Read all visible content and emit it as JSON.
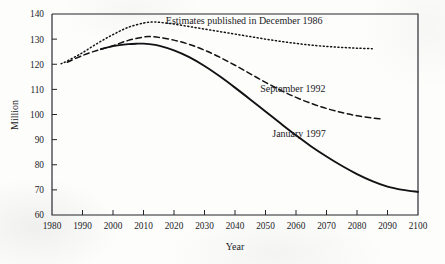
{
  "chart_data": {
    "type": "line",
    "title": "",
    "xlabel": "Year",
    "ylabel": "Million",
    "xlim": [
      1980,
      2100
    ],
    "ylim": [
      60,
      140
    ],
    "grid": false,
    "legend_position": "inline-annotations",
    "x_ticks": [
      1980,
      1990,
      2000,
      2010,
      2020,
      2030,
      2040,
      2050,
      2060,
      2070,
      2080,
      2090,
      2100
    ],
    "y_ticks": [
      60,
      70,
      80,
      90,
      100,
      110,
      120,
      130,
      140
    ],
    "series": [
      {
        "name": "Estimates published in December 1986",
        "style": "dotted",
        "label_x": 2043,
        "label_y": 137.5,
        "x": [
          1983,
          1985,
          1990,
          1995,
          2000,
          2005,
          2010,
          2013,
          2015,
          2020,
          2025,
          2030,
          2035,
          2040,
          2045,
          2050,
          2055,
          2060,
          2065,
          2070,
          2075,
          2080,
          2085
        ],
        "values": [
          120.2,
          121.3,
          124.6,
          128.4,
          131.8,
          134.7,
          136.4,
          136.8,
          136.7,
          136.0,
          135.0,
          134.0,
          133.0,
          132.0,
          131.0,
          130.0,
          129.1,
          128.3,
          127.6,
          127.1,
          126.7,
          126.4,
          126.2
        ]
      },
      {
        "name": "September 1992",
        "style": "dashed",
        "label_x": 2059,
        "label_y": 110.5,
        "x": [
          1985,
          1990,
          1995,
          2000,
          2005,
          2010,
          2012,
          2015,
          2020,
          2025,
          2030,
          2035,
          2040,
          2045,
          2050,
          2055,
          2060,
          2065,
          2070,
          2075,
          2080,
          2085,
          2088
        ],
        "values": [
          120.8,
          123.5,
          125.6,
          127.4,
          129.5,
          130.8,
          131.0,
          130.7,
          129.6,
          127.9,
          125.6,
          122.8,
          119.6,
          116.2,
          112.8,
          109.6,
          106.8,
          104.4,
          102.4,
          100.8,
          99.5,
          98.6,
          98.2
        ]
      },
      {
        "name": "January 1997",
        "style": "solid",
        "label_x": 2061,
        "label_y": 92.5,
        "x": [
          1996,
          2000,
          2005,
          2008,
          2010,
          2012,
          2015,
          2020,
          2025,
          2030,
          2035,
          2040,
          2045,
          2050,
          2055,
          2060,
          2065,
          2070,
          2075,
          2080,
          2085,
          2090,
          2095,
          2100
        ],
        "values": [
          126.0,
          127.2,
          128.0,
          128.2,
          128.2,
          128.0,
          127.4,
          125.5,
          122.8,
          119.3,
          115.2,
          110.7,
          106.0,
          101.2,
          96.4,
          91.7,
          87.3,
          83.3,
          79.6,
          76.3,
          73.5,
          71.3,
          70.0,
          69.2
        ]
      }
    ]
  },
  "axis": {
    "x_title": "Year",
    "y_title": "Million"
  }
}
